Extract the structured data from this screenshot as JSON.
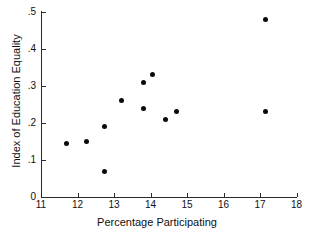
{
  "chart_data": {
    "type": "scatter",
    "title": "",
    "xlabel": "Percentage Participating",
    "ylabel": "Index of Education Equality",
    "xlim": [
      11,
      18
    ],
    "ylim": [
      0,
      0.5
    ],
    "grid": false,
    "legend": null,
    "xticks": [
      "11",
      "12",
      "13",
      "14",
      "15",
      "16",
      "17",
      "18"
    ],
    "xtick_values": [
      11,
      12,
      13,
      14,
      15,
      16,
      17,
      18
    ],
    "yticks": [
      "0",
      ".1",
      ".2",
      ".3",
      ".4",
      ".5"
    ],
    "ytick_values": [
      0,
      0.1,
      0.2,
      0.3,
      0.4,
      0.5
    ],
    "marker": "filled-circle",
    "marker_color": "#0a0a0a",
    "axis_color": "#2b2b2b",
    "background_color": "#ffffff",
    "points": [
      {
        "x": 11.7,
        "y": 0.145
      },
      {
        "x": 12.25,
        "y": 0.15
      },
      {
        "x": 12.75,
        "y": 0.19
      },
      {
        "x": 12.75,
        "y": 0.07
      },
      {
        "x": 13.2,
        "y": 0.26
      },
      {
        "x": 13.8,
        "y": 0.31
      },
      {
        "x": 13.8,
        "y": 0.24
      },
      {
        "x": 14.05,
        "y": 0.33
      },
      {
        "x": 14.4,
        "y": 0.21
      },
      {
        "x": 14.7,
        "y": 0.23
      },
      {
        "x": 17.15,
        "y": 0.48
      },
      {
        "x": 17.15,
        "y": 0.23
      }
    ]
  }
}
